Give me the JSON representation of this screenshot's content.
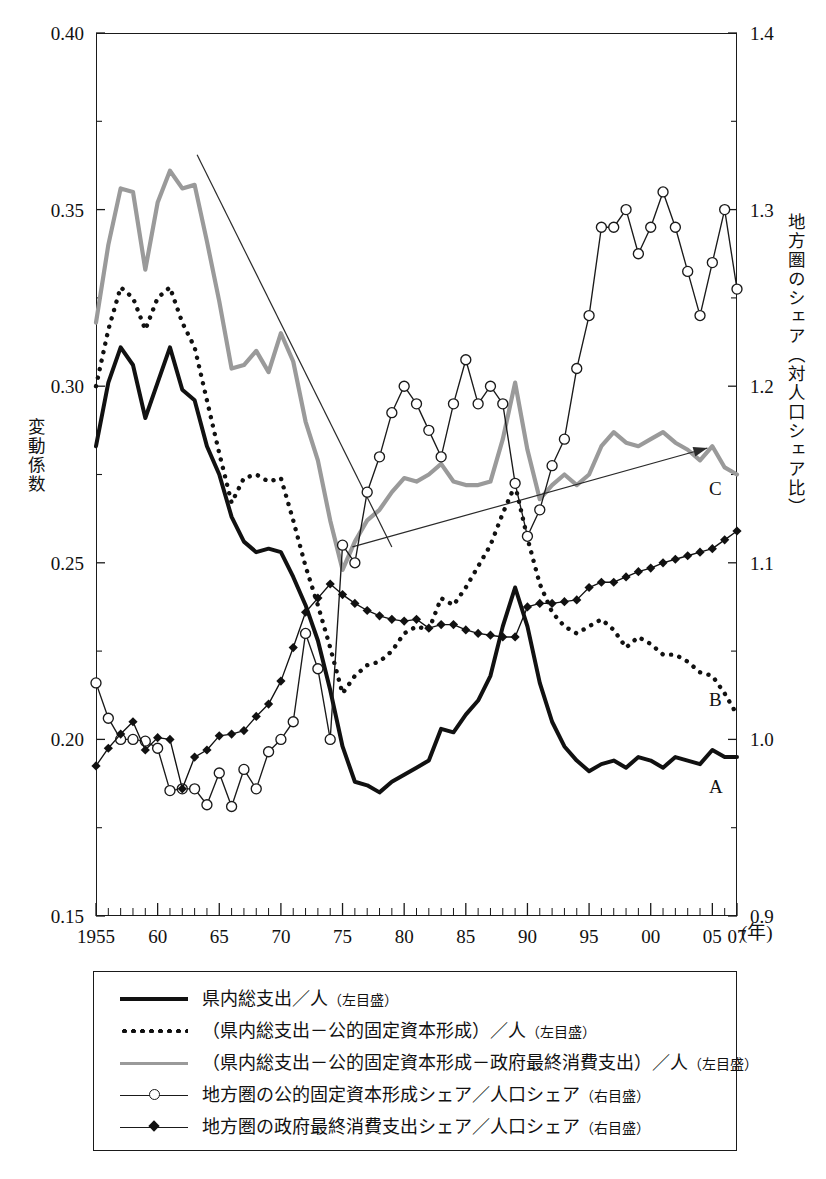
{
  "axes": {
    "y_left": {
      "title": "変動係数",
      "ticks": [
        "0.40",
        "0.35",
        "0.30",
        "0.25",
        "0.20",
        "0.15"
      ],
      "min": 0.15,
      "max": 0.4
    },
    "y_right": {
      "title": "地方圏のシェア（対人口シェア比）",
      "ticks": [
        "1.4",
        "1.3",
        "1.2",
        "1.1",
        "1.0",
        "0.9"
      ],
      "min": 0.9,
      "max": 1.4
    },
    "x": {
      "ticks": [
        "1955",
        "60",
        "65",
        "70",
        "75",
        "80",
        "85",
        "90",
        "95",
        "00",
        "05",
        "07"
      ],
      "unit": "(年)",
      "min": 1955,
      "max": 2007
    }
  },
  "series_tags": {
    "a": "A",
    "b": "B",
    "c": "C"
  },
  "legend": {
    "items": [
      {
        "key": "solid-thick",
        "label": "県内総支出／人",
        "scale": "（左目盛）"
      },
      {
        "key": "dotted",
        "label": "（県内総支出－公的固定資本形成）／人",
        "scale": "（左目盛）"
      },
      {
        "key": "solid-gray",
        "label": "（県内総支出－公的固定資本形成－政府最終消費支出）／人",
        "scale": "（左目盛）"
      },
      {
        "key": "open-circle",
        "label": "地方圏の公的固定資本形成シェア／人口シェア",
        "scale": "（右目盛）"
      },
      {
        "key": "filled-diamond",
        "label": "地方圏の政府最終消費支出シェア／人口シェア",
        "scale": "（右目盛）"
      }
    ]
  },
  "chart_data": {
    "type": "line",
    "title": "",
    "xlabel": "(年)",
    "ylabel": "変動係数",
    "y2label": "地方圏のシェア（対人口シェア比）",
    "xlim": [
      1955,
      2007
    ],
    "ylim": [
      0.15,
      0.4
    ],
    "y2lim": [
      0.9,
      1.4
    ],
    "grid": false,
    "legend_position": "below-plot",
    "x": [
      1955,
      1956,
      1957,
      1958,
      1959,
      1960,
      1961,
      1962,
      1963,
      1964,
      1965,
      1966,
      1967,
      1968,
      1969,
      1970,
      1971,
      1972,
      1973,
      1974,
      1975,
      1976,
      1977,
      1978,
      1979,
      1980,
      1981,
      1982,
      1983,
      1984,
      1985,
      1986,
      1987,
      1988,
      1989,
      1990,
      1991,
      1992,
      1993,
      1994,
      1995,
      1996,
      1997,
      1998,
      1999,
      2000,
      2001,
      2002,
      2003,
      2004,
      2005,
      2006,
      2007
    ],
    "series": [
      {
        "name": "県内総支出／人（左目盛）",
        "tag": "A",
        "axis": "left",
        "style": "solid-thick",
        "color": "#111111",
        "values": [
          0.283,
          0.301,
          0.311,
          0.306,
          0.291,
          0.301,
          0.311,
          0.299,
          0.296,
          0.283,
          0.275,
          0.263,
          0.256,
          0.253,
          0.254,
          0.253,
          0.246,
          0.238,
          0.228,
          0.214,
          0.198,
          0.188,
          0.187,
          0.185,
          0.188,
          0.19,
          0.192,
          0.194,
          0.203,
          0.202,
          0.207,
          0.211,
          0.218,
          0.232,
          0.243,
          0.232,
          0.216,
          0.205,
          0.198,
          0.194,
          0.191,
          0.193,
          0.194,
          0.192,
          0.195,
          0.194,
          0.192,
          0.195,
          0.194,
          0.193,
          0.197,
          0.195,
          0.195
        ]
      },
      {
        "name": "（県内総支出－公的固定資本形成）／人（左目盛）",
        "tag": "B",
        "axis": "left",
        "style": "dotted",
        "color": "#111111",
        "values": [
          0.3,
          0.316,
          0.328,
          0.325,
          0.316,
          0.325,
          0.328,
          0.318,
          0.311,
          0.296,
          0.281,
          0.267,
          0.274,
          0.275,
          0.273,
          0.274,
          0.262,
          0.249,
          0.238,
          0.226,
          0.213,
          0.218,
          0.221,
          0.222,
          0.225,
          0.23,
          0.232,
          0.231,
          0.24,
          0.238,
          0.243,
          0.249,
          0.255,
          0.264,
          0.272,
          0.257,
          0.244,
          0.236,
          0.232,
          0.23,
          0.232,
          0.234,
          0.231,
          0.226,
          0.229,
          0.227,
          0.224,
          0.224,
          0.222,
          0.219,
          0.218,
          0.213,
          0.207
        ]
      },
      {
        "name": "（県内総支出－公的固定資本形成－政府最終消費支出）／人（左目盛）",
        "tag": "C",
        "axis": "left",
        "style": "solid-gray",
        "color": "#9a9a9a",
        "values": [
          0.318,
          0.34,
          0.356,
          0.355,
          0.333,
          0.352,
          0.361,
          0.356,
          0.357,
          0.341,
          0.324,
          0.305,
          0.306,
          0.31,
          0.304,
          0.315,
          0.307,
          0.29,
          0.279,
          0.262,
          0.248,
          0.256,
          0.262,
          0.265,
          0.27,
          0.274,
          0.273,
          0.275,
          0.278,
          0.273,
          0.272,
          0.272,
          0.273,
          0.285,
          0.301,
          0.282,
          0.268,
          0.272,
          0.275,
          0.272,
          0.275,
          0.283,
          0.287,
          0.284,
          0.283,
          0.285,
          0.287,
          0.284,
          0.282,
          0.279,
          0.283,
          0.277,
          0.275
        ]
      },
      {
        "name": "地方圏の公的固定資本形成シェア／人口シェア（右目盛）",
        "axis": "right",
        "style": "open-circle",
        "color": "#1a1a1a",
        "values": [
          1.032,
          1.012,
          1.0,
          1.0,
          0.999,
          0.995,
          0.971,
          0.972,
          0.972,
          0.963,
          0.981,
          0.962,
          0.983,
          0.972,
          0.993,
          1.0,
          1.01,
          1.06,
          1.04,
          1.0,
          1.11,
          1.1,
          1.14,
          1.16,
          1.185,
          1.2,
          1.19,
          1.175,
          1.16,
          1.19,
          1.215,
          1.19,
          1.2,
          1.19,
          1.145,
          1.115,
          1.13,
          1.155,
          1.17,
          1.21,
          1.24,
          1.29,
          1.29,
          1.3,
          1.275,
          1.29,
          1.31,
          1.29,
          1.265,
          1.24,
          1.27,
          1.3,
          1.255
        ]
      },
      {
        "name": "地方圏の政府最終消費支出シェア／人口シェア（右目盛）",
        "axis": "right",
        "style": "filled-diamond",
        "color": "#111111",
        "values": [
          0.985,
          0.995,
          1.003,
          1.01,
          0.994,
          1.001,
          1.0,
          0.972,
          0.99,
          0.994,
          1.002,
          1.003,
          1.005,
          1.013,
          1.02,
          1.033,
          1.052,
          1.072,
          1.08,
          1.088,
          1.082,
          1.077,
          1.073,
          1.07,
          1.068,
          1.067,
          1.068,
          1.063,
          1.065,
          1.065,
          1.062,
          1.06,
          1.059,
          1.058,
          1.058,
          1.075,
          1.077,
          1.077,
          1.078,
          1.079,
          1.086,
          1.089,
          1.089,
          1.092,
          1.095,
          1.097,
          1.1,
          1.102,
          1.104,
          1.106,
          1.108,
          1.113,
          1.118
        ]
      }
    ],
    "annotations": [
      {
        "name": "downward-trend-line",
        "x1": 1963.2,
        "y1_left": 0.3655,
        "x2": 1979.0,
        "y2_left": 0.2545
      },
      {
        "name": "upward-trend-arrow",
        "x1": 1975.8,
        "y1_left": 0.2545,
        "x2": 2004.6,
        "y2_left": 0.2825
      }
    ]
  }
}
